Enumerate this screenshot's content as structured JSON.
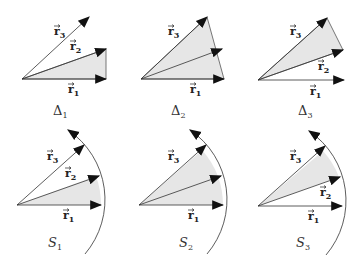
{
  "colors": {
    "fill": "#e6e6e6",
    "stroke": "#333333",
    "arrow": "#111111"
  },
  "vector_labels": {
    "r1": "r",
    "r2": "r",
    "r3": "r",
    "arrow_mark": "→"
  },
  "subscripts": {
    "one": "1",
    "two": "2",
    "three": "3"
  },
  "panels": {
    "delta1": {
      "caption": "Δ",
      "sub": "1"
    },
    "delta2": {
      "caption": "Δ",
      "sub": "2"
    },
    "delta3": {
      "caption": "Δ",
      "sub": "3"
    },
    "s1": {
      "caption": "S",
      "sub": "1"
    },
    "s2": {
      "caption": "S",
      "sub": "2"
    },
    "s3": {
      "caption": "S",
      "sub": "3"
    }
  }
}
